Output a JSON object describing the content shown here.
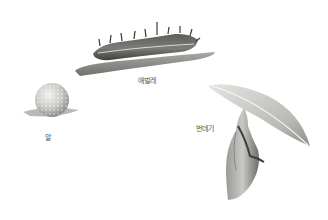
{
  "diagram": {
    "type": "life-cycle-illustration",
    "stages": [
      {
        "id": "egg",
        "label": "알"
      },
      {
        "id": "larva",
        "label": "애벌레"
      },
      {
        "id": "pupa",
        "label": "번데기"
      }
    ]
  },
  "colors": {
    "background": "#ffffff",
    "leaf": "#8a8a86",
    "body_dark": "#4a4a48",
    "body_mid": "#8c8c88",
    "egg": "#cfcfcb",
    "label": "#555555"
  }
}
